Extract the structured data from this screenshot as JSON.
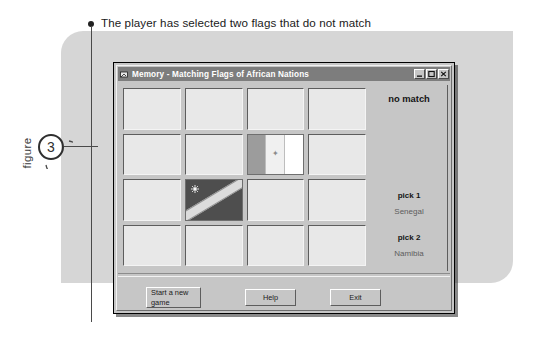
{
  "figure": {
    "word": "figure",
    "number": "3"
  },
  "caption": {
    "text": "The player has selected two flags that do not match"
  },
  "window": {
    "title": "Memory - Matching Flags of African Nations",
    "title_icon": "app-icon",
    "controls": [
      {
        "name": "minimize",
        "glyph": "minimize-icon"
      },
      {
        "name": "maximize",
        "glyph": "maximize-icon"
      },
      {
        "name": "close",
        "glyph": "close-icon"
      }
    ]
  },
  "board": {
    "rows": 4,
    "columns": 4,
    "cards": [
      {
        "state": "face-down",
        "flag": null
      },
      {
        "state": "face-down",
        "flag": null
      },
      {
        "state": "face-down",
        "flag": null
      },
      {
        "state": "face-down",
        "flag": null
      },
      {
        "state": "face-down",
        "flag": null
      },
      {
        "state": "face-down",
        "flag": null
      },
      {
        "state": "revealed",
        "flag": "senegal"
      },
      {
        "state": "face-down",
        "flag": null
      },
      {
        "state": "face-down",
        "flag": null
      },
      {
        "state": "revealed",
        "flag": "namibia"
      },
      {
        "state": "face-down",
        "flag": null
      },
      {
        "state": "face-down",
        "flag": null
      },
      {
        "state": "face-down",
        "flag": null
      },
      {
        "state": "face-down",
        "flag": null
      },
      {
        "state": "face-down",
        "flag": null
      },
      {
        "state": "face-down",
        "flag": null
      }
    ]
  },
  "status": {
    "result": "no match",
    "pick1_label": "pick 1",
    "pick1_value": "Senegal",
    "pick2_label": "pick 2",
    "pick2_value": "Namibia"
  },
  "buttons": {
    "new_game": "Start a new game",
    "help": "Help",
    "exit": "Exit"
  },
  "colors": {
    "page_panel": "#d6d6d6",
    "window_face": "#c6c6c6",
    "titlebar": "#7d7d7d",
    "card_face_down": "#e8e8e8",
    "namibia_field": "#4e4e4e",
    "senegal_band": "#9c9c9c"
  }
}
